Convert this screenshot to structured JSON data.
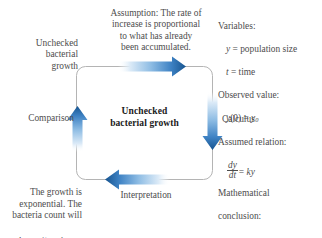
{
  "diagram": {
    "center": {
      "line1": "Unchecked",
      "line2": "bacterial growth"
    },
    "nodes": {
      "real_world_situation": "Unchecked\nbacterial\ngrowth",
      "assumption": "Assumption: The rate of\nincrease is proportional\nto what has already\nbeen accumulated.",
      "comparison_label": "Comparison",
      "calculus_label": "Calculus",
      "interpretation_label": "Interpretation",
      "conclusion_text": "The growth is\nexponential. The\nbacteria count will",
      "conclusion_formula_prefix": "be ",
      "conclusion_formula_y": "y",
      "conclusion_formula_sub": "0",
      "conclusion_formula_e": "e",
      "conclusion_formula_exp": "kt",
      "conclusion_formula_suffix": " at time ",
      "conclusion_formula_t": "t",
      "conclusion_formula_period": "."
    },
    "math_panel": {
      "variables_heading": "Variables:",
      "variable_y": "y",
      "variable_y_def": " = population size",
      "variable_t": "t",
      "variable_t_def": " = time",
      "observed_heading": "Observed value:",
      "observed_lhs": "y",
      "observed_lhs_arg": "(0)",
      "observed_eq": " = ",
      "observed_rhs": "y",
      "observed_rhs_sub": "0",
      "assumed_heading": "Assumed relation:",
      "fraction_numerator": "dy",
      "fraction_denominator": "dt",
      "fraction_eq": "= ",
      "fraction_rhs": "ky"
    },
    "math_conclusion": {
      "heading_line1": "Mathematical",
      "heading_line2": "conclusion:",
      "formula_lhs": "y",
      "formula_eq": " = ",
      "formula_rhs_y": "y",
      "formula_rhs_sub": "0",
      "formula_rhs_e": "e",
      "formula_rhs_exp": "kt"
    },
    "arrows": [
      {
        "name": "top-arrow",
        "direction": "right",
        "label": "Assumption"
      },
      {
        "name": "right-arrow",
        "direction": "down",
        "label": "Calculus"
      },
      {
        "name": "bottom-arrow",
        "direction": "left",
        "label": "Interpretation"
      },
      {
        "name": "left-arrow",
        "direction": "up",
        "label": "Comparison"
      }
    ],
    "colors": {
      "arrow_dark": "#1a5fa8",
      "arrow_mid": "#4f8fcd",
      "arrow_light": "#ffffff",
      "box_border": "#b4b4b4",
      "text": "#4d4d4d",
      "center_text": "#1a1a1a",
      "background": "#ffffff"
    }
  }
}
